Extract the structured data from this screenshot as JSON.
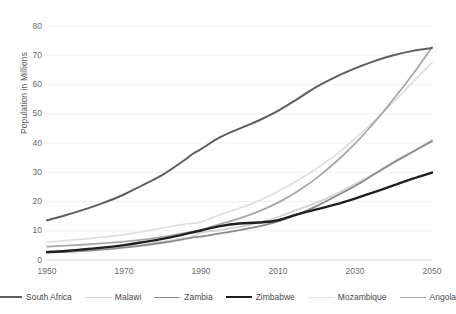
{
  "chart_data": {
    "type": "line",
    "title": "",
    "xlabel": "",
    "ylabel": "Population in Millions",
    "xlim": [
      1950,
      2050
    ],
    "ylim": [
      0,
      80
    ],
    "grid": true,
    "legend_position": "bottom",
    "xticks": [
      "1950",
      "1970",
      "1990",
      "2010",
      "2030",
      "2050"
    ],
    "yticks": [
      "0",
      "10",
      "20",
      "30",
      "40",
      "50",
      "60",
      "70",
      "80"
    ],
    "x": [
      1950,
      1955,
      1960,
      1965,
      1970,
      1975,
      1980,
      1985,
      1988,
      1990,
      1995,
      2000,
      2005,
      2010,
      2015,
      2020,
      2025,
      2030,
      2035,
      2040,
      2045,
      2050
    ],
    "series": [
      {
        "name": "South Africa",
        "color": "#5e5e5e",
        "width": 2.0,
        "values": [
          13.6,
          15.4,
          17.4,
          19.7,
          22.4,
          25.7,
          29.1,
          33.5,
          36.4,
          37.9,
          42.0,
          44.9,
          47.7,
          51.0,
          55.0,
          59.2,
          62.6,
          65.5,
          68.0,
          70.0,
          71.5,
          72.5
        ]
      },
      {
        "name": "Malawi",
        "color": "#d2d2d2",
        "width": 1.8,
        "values": [
          3.0,
          3.3,
          3.6,
          4.0,
          4.5,
          5.2,
          6.2,
          7.3,
          8.0,
          9.4,
          10.2,
          11.3,
          12.8,
          14.7,
          17.2,
          19.6,
          22.5,
          26.0,
          29.5,
          33.5,
          37.0,
          41.0
        ]
      },
      {
        "name": "Zambia",
        "color": "#8c8c8c",
        "width": 1.8,
        "values": [
          2.5,
          2.8,
          3.1,
          3.6,
          4.2,
          5.0,
          5.9,
          7.0,
          7.7,
          8.0,
          9.1,
          10.2,
          11.5,
          13.2,
          15.5,
          18.4,
          21.8,
          25.3,
          29.3,
          33.3,
          37.0,
          40.6
        ]
      },
      {
        "name": "Zimbabwe",
        "color": "#1f1f1f",
        "width": 2.4,
        "values": [
          2.7,
          3.1,
          3.7,
          4.3,
          5.1,
          6.1,
          7.2,
          8.6,
          9.5,
          10.1,
          11.6,
          12.5,
          12.8,
          13.6,
          15.6,
          17.3,
          19.0,
          21.0,
          23.2,
          25.5,
          27.8,
          29.9
        ]
      },
      {
        "name": "Mozambique",
        "color": "#e0e0e0",
        "width": 1.8,
        "values": [
          6.2,
          6.6,
          7.2,
          7.9,
          8.7,
          9.7,
          11.0,
          12.1,
          12.6,
          13.0,
          15.5,
          17.7,
          20.2,
          23.5,
          27.1,
          31.3,
          36.0,
          41.5,
          47.5,
          54.0,
          60.8,
          67.5
        ]
      },
      {
        "name": "Angola",
        "color": "#a8a8a8",
        "width": 1.8,
        "values": [
          4.6,
          4.9,
          5.3,
          5.8,
          6.3,
          7.0,
          7.9,
          9.0,
          9.7,
          10.2,
          12.3,
          14.2,
          16.6,
          19.6,
          23.4,
          28.0,
          33.5,
          39.8,
          47.0,
          55.0,
          63.5,
          72.8
        ]
      }
    ]
  },
  "legend": {
    "items": [
      {
        "label": "South Africa"
      },
      {
        "label": "Malawi"
      },
      {
        "label": "Zambia"
      },
      {
        "label": "Zimbabwe"
      },
      {
        "label": "Mozambique"
      },
      {
        "label": "Angola"
      }
    ]
  }
}
